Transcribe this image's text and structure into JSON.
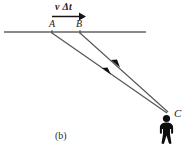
{
  "figure": {
    "panel_label": "(b)",
    "background_color": "#ffffff",
    "width": 185,
    "height": 154,
    "ink_color": "#1a1a1a",
    "line_color": "#8a8a8a",
    "ray_color": "#555555"
  },
  "labels": {
    "displacement": "v Δt",
    "point_a": "A",
    "point_b": "B",
    "observer": "C"
  },
  "geometry": {
    "horizontal_line": {
      "x1": 4,
      "y1": 32,
      "x2": 146,
      "y2": 32
    },
    "velocity_arrow": {
      "x1": 52,
      "y1": 16,
      "x2": 82,
      "y2": 16
    },
    "ray_from_a": {
      "x1": 52,
      "y1": 33,
      "x2": 167,
      "y2": 113
    },
    "ray_from_b": {
      "x1": 80,
      "y1": 33,
      "x2": 168,
      "y2": 112
    },
    "observer_position": {
      "x": 166,
      "y": 118
    }
  },
  "annotations": {
    "ray_a_arrowhead_fraction": 0.52,
    "ray_b_arrowhead_fraction": 0.58,
    "arrowhead_direction": "toward-upper-left"
  }
}
